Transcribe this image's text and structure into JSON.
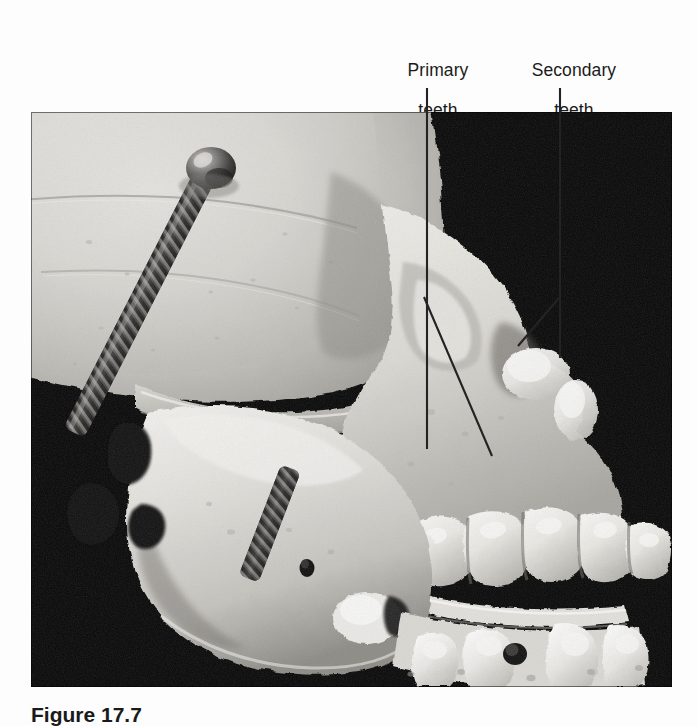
{
  "figure": {
    "caption": "Figure 17.7",
    "photo_alt": "photograph-of-juvenile-human-skull-lateral-view-showing-primary-and-developing-secondary-teeth",
    "background_color": "#ffffff",
    "photo_background_color": "#000000",
    "label_color": "#1b1b1b",
    "leader_line_color": "#232323"
  },
  "callouts": [
    {
      "id": "primary",
      "line1": "Primary",
      "line2": "teeth",
      "text": "Primary teeth"
    },
    {
      "id": "secondary",
      "line1": "Secondary",
      "line2": "teeth",
      "text": "Secondary teeth"
    }
  ],
  "leader_lines": [
    {
      "name": "primary-vertical",
      "x1": 427,
      "y1": 88,
      "x2": 427,
      "y2": 449
    },
    {
      "name": "primary-diagonal",
      "x1": 424,
      "y1": 297,
      "x2": 492,
      "y2": 456
    },
    {
      "name": "secondary-vertical",
      "x1": 560,
      "y1": 88,
      "x2": 560,
      "y2": 358
    },
    {
      "name": "secondary-diagonal",
      "x1": 559,
      "y1": 298,
      "x2": 518,
      "y2": 346
    }
  ],
  "photo": {
    "x": 31,
    "y": 112,
    "width": 641,
    "height": 575
  }
}
